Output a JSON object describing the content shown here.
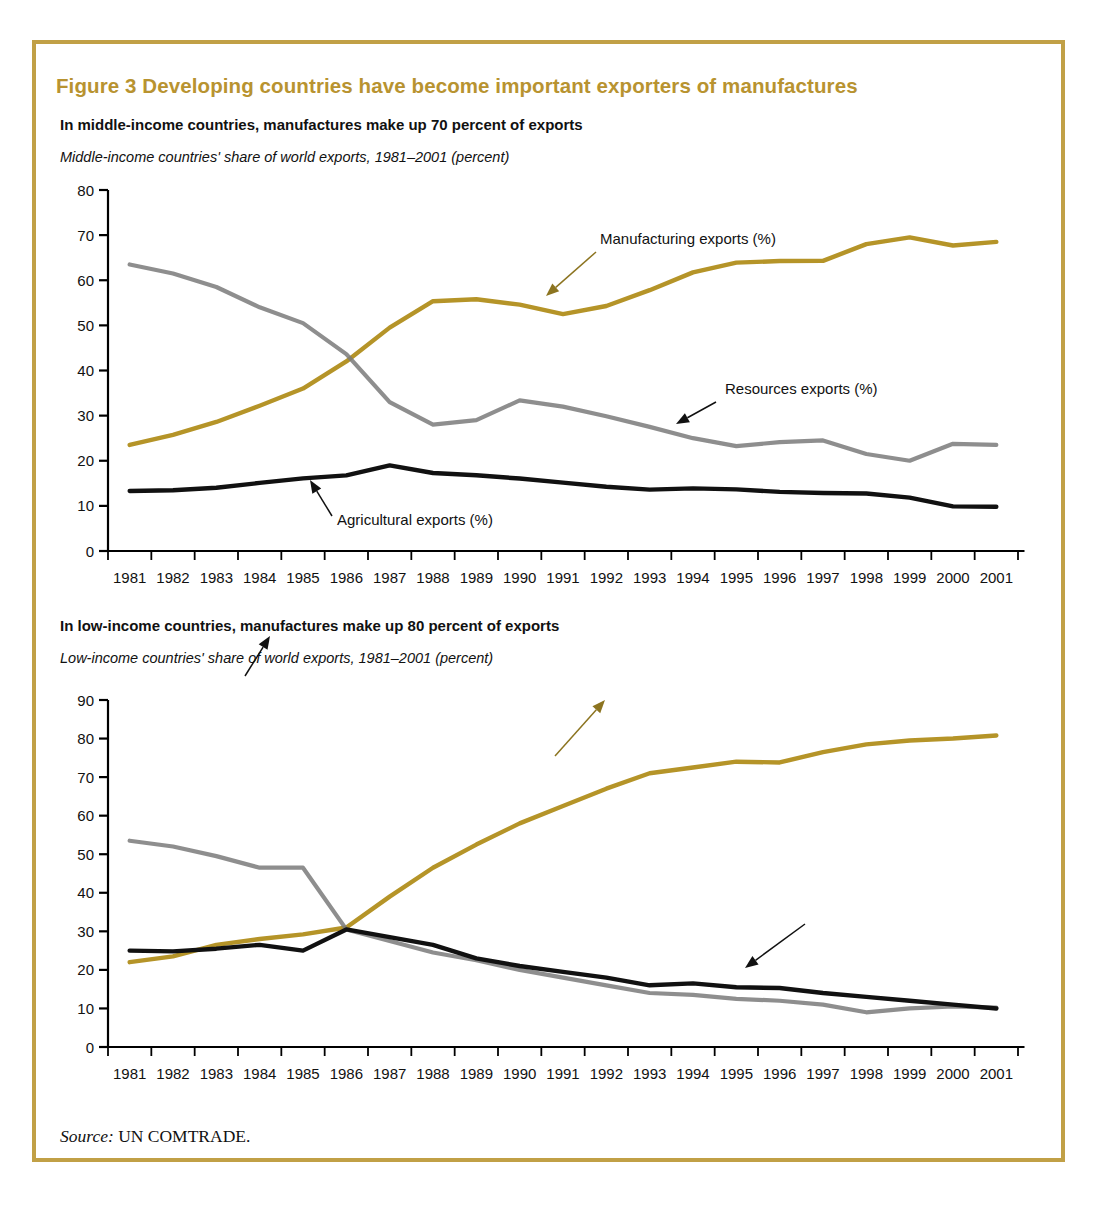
{
  "figure": {
    "title": "Figure 3  Developing countries have become important exporters of manufactures",
    "title_color": "#b89330",
    "border_color": "#c1a046",
    "source_prefix": "Source:",
    "source_text": " UN COMTRADE."
  },
  "colors": {
    "manufacturing": "#b59428",
    "resources": "#7a7a7a",
    "agricultural": "#111111",
    "axis": "#000000"
  },
  "panels": [
    {
      "heading": "In middle-income countries, manufactures make up 70 percent of exports",
      "subtitle": "Middle-income countries' share of world exports, 1981–2001 (percent)",
      "annotations": [
        {
          "label": "Manufacturing exports (%)",
          "x": 600,
          "y": 244
        },
        {
          "label": "Resources exports (%)",
          "x": 725,
          "y": 394
        },
        {
          "label": "Agricultural exports (%)",
          "x": 337,
          "y": 525
        }
      ]
    },
    {
      "heading": "In low-income countries, manufactures make up 80 percent of exports",
      "subtitle": "Low-income countries' share of world exports, 1981–2001 (percent)",
      "annotations": [
        {
          "label": "Resources exports (%)",
          "x": 157,
          "y": 566
        },
        {
          "label": "Manufacturing exports (%)",
          "x": 497,
          "y": 744
        },
        {
          "label": "Agricultural exports (%)",
          "x": 813,
          "y": 912
        }
      ]
    }
  ],
  "chart_data": [
    {
      "type": "line",
      "title": "In middle-income countries, manufactures make up 70 percent of exports",
      "subtitle": "Middle-income countries' share of world exports, 1981–2001 (percent)",
      "xlabel": "",
      "ylabel": "percent",
      "ylim": [
        0,
        80
      ],
      "yticks": [
        0,
        10,
        20,
        30,
        40,
        50,
        60,
        70,
        80
      ],
      "grid": false,
      "legend_position": "inline-annotations",
      "categories": [
        "1981",
        "1982",
        "1983",
        "1984",
        "1985",
        "1986",
        "1987",
        "1988",
        "1989",
        "1990",
        "1991",
        "1992",
        "1993",
        "1994",
        "1995",
        "1996",
        "1997",
        "1998",
        "1999",
        "2000",
        "2001"
      ],
      "series": [
        {
          "name": "Manufacturing exports (%)",
          "color": "#b59428",
          "values": [
            23.5,
            25.5,
            28.0,
            31.0,
            35.0,
            37.5,
            46.5,
            51.5,
            57.0,
            55.5,
            54.5,
            52.5,
            54.0,
            57.0,
            61.0,
            63.5,
            64.5,
            64.0,
            64.5,
            69.5,
            69.5,
            67.5,
            68.5
          ]
        },
        {
          "name": "Resources exports (%)",
          "color": "#7a7a7a",
          "values": [
            63.5,
            62.0,
            60.0,
            57.0,
            53.0,
            50.5,
            46.5,
            35.0,
            31.0,
            27.0,
            29.0,
            33.5,
            33.0,
            31.0,
            29.5,
            27.5,
            25.5,
            23.5,
            23.0,
            24.5,
            24.5,
            22.5,
            18.5,
            21.5,
            24.5,
            23.5
          ]
        },
        {
          "name": "Agricultural exports (%)",
          "color": "#111111",
          "values": [
            13.3,
            13.4,
            13.8,
            14.5,
            15.8,
            16.3,
            16.9,
            19.2,
            17.3,
            16.9,
            16.3,
            15.6,
            14.7,
            14.0,
            13.5,
            13.9,
            13.7,
            13.2,
            12.8,
            12.9,
            12.6,
            11.5,
            9.6,
            9.8
          ]
        }
      ],
      "series_clean": [
        {
          "name": "Manufacturing exports (%)",
          "color": "#b59428",
          "values": [
            23.5,
            26.0,
            29.0,
            32.5,
            35.2,
            37.3,
            46.5,
            51.5,
            57.0,
            55.3,
            54.2,
            52.5,
            54.0,
            57.2,
            61.0,
            63.7,
            64.4,
            64.0,
            64.6,
            67.5,
            69.5,
            69.3,
            67.2,
            68.3
          ]
        }
      ]
    },
    {
      "type": "line",
      "title": "In low-income countries, manufactures make up 80 percent of exports",
      "subtitle": "Low-income countries' share of world exports, 1981–2001 (percent)",
      "xlabel": "",
      "ylabel": "percent",
      "ylim": [
        0,
        90
      ],
      "yticks": [
        0,
        10,
        20,
        30,
        40,
        50,
        60,
        70,
        80,
        90
      ],
      "grid": false,
      "legend_position": "inline-annotations",
      "categories": [
        "1981",
        "1982",
        "1983",
        "1984",
        "1985",
        "1986",
        "1987",
        "1988",
        "1989",
        "1990",
        "1991",
        "1992",
        "1993",
        "1994",
        "1995",
        "1996",
        "1997",
        "1998",
        "1999",
        "2000",
        "2001"
      ],
      "series": [
        {
          "name": "Manufacturing exports (%)",
          "color": "#b59428",
          "values": [
            22.0,
            23.5,
            26.5,
            28.0,
            29.2,
            31.0,
            39.0,
            46.5,
            52.5,
            58.0,
            62.5,
            67.0,
            71.0,
            72.5,
            74.0,
            73.8,
            76.5,
            78.5,
            79.5,
            80.0,
            80.8
          ]
        },
        {
          "name": "Resources exports (%)",
          "color": "#7a7a7a",
          "values": [
            53.5,
            52.0,
            49.5,
            46.5,
            46.5,
            30.5,
            27.5,
            24.5,
            22.5,
            20.0,
            18.0,
            16.0,
            14.0,
            13.5,
            12.5,
            12.0,
            11.0,
            9.0,
            10.0,
            10.5,
            10.2
          ]
        },
        {
          "name": "Agricultural exports (%)",
          "color": "#111111",
          "values": [
            25.0,
            24.8,
            25.5,
            26.5,
            25.0,
            30.5,
            28.5,
            26.5,
            23.0,
            21.0,
            19.5,
            18.0,
            16.0,
            16.5,
            15.5,
            15.3,
            14.0,
            13.0,
            12.0,
            11.0,
            10.0
          ]
        }
      ]
    }
  ],
  "axes": {
    "panel1_yticks": [
      "80",
      "70",
      "60",
      "50",
      "40",
      "30",
      "20",
      "10",
      "0"
    ],
    "panel2_yticks": [
      "90",
      "80",
      "70",
      "60",
      "50",
      "40",
      "30",
      "20",
      "10",
      "0"
    ],
    "xticks": [
      "1981",
      "1982",
      "1983",
      "1984",
      "1985",
      "1986",
      "1987",
      "1988",
      "1989",
      "1990",
      "1991",
      "1992",
      "1993",
      "1994",
      "1995",
      "1996",
      "1997",
      "1998",
      "1999",
      "2000",
      "2001"
    ]
  }
}
